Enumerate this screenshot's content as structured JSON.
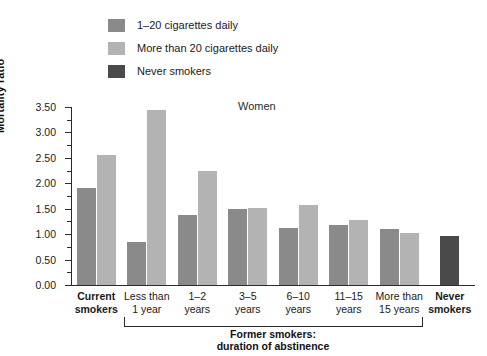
{
  "chart_data": {
    "type": "bar",
    "title": "Women",
    "xlabel": "",
    "ylabel": "Mortality ratio",
    "ylim": [
      0.0,
      3.5
    ],
    "ytick_labels": [
      "0.00",
      "0.50",
      "1.00",
      "1.50",
      "2.00",
      "2.50",
      "3.00",
      "3.50"
    ],
    "ytick_values": [
      0.0,
      0.5,
      1.0,
      1.5,
      2.0,
      2.5,
      3.0,
      3.5
    ],
    "minor_tick_interval": 0.25,
    "grid": false,
    "legend_position": "top-left",
    "categories": [
      "Current smokers",
      "Less than 1 year",
      "1–2 years",
      "3–5 years",
      "6–10 years",
      "11–15 years",
      "More than 15 years",
      "Never smokers"
    ],
    "series": [
      {
        "name": "1–20 cigarettes daily",
        "color": "#8a8a8a",
        "values": [
          1.9,
          0.85,
          1.37,
          1.5,
          1.12,
          1.18,
          1.1,
          null
        ]
      },
      {
        "name": "More than 20 cigarettes daily",
        "color": "#b3b3b3",
        "values": [
          2.55,
          3.45,
          2.25,
          1.52,
          1.57,
          1.27,
          1.03,
          null
        ]
      },
      {
        "name": "Never smokers",
        "color": "#4a4a4a",
        "values": [
          null,
          null,
          null,
          null,
          null,
          null,
          null,
          0.97
        ]
      }
    ],
    "annotations": [
      "Former smokers: duration of abstinence"
    ]
  },
  "legend": {
    "items": [
      {
        "label": "1–20 cigarettes daily",
        "color": "#8a8a8a"
      },
      {
        "label": "More than 20 cigarettes daily",
        "color": "#b3b3b3"
      },
      {
        "label": "Never smokers",
        "color": "#4a4a4a"
      }
    ]
  },
  "axis": {
    "y_title": "Mortality ratio",
    "y_labels": [
      "3.50",
      "3.00",
      "2.50",
      "2.00",
      "1.50",
      "1.00",
      "0.50",
      "0.00"
    ]
  },
  "categories": [
    {
      "line1": "Current",
      "line2": "smokers",
      "bold": true
    },
    {
      "line1": "Less than",
      "line2": "1 year",
      "bold": false
    },
    {
      "line1": "1–2",
      "line2": "years",
      "bold": false
    },
    {
      "line1": "3–5",
      "line2": "years",
      "bold": false
    },
    {
      "line1": "6–10",
      "line2": "years",
      "bold": false
    },
    {
      "line1": "11–15",
      "line2": "years",
      "bold": false
    },
    {
      "line1": "More than",
      "line2": "15 years",
      "bold": false
    },
    {
      "line1": "Never",
      "line2": "smokers",
      "bold": true
    }
  ],
  "bracket": {
    "caption_line1": "Former smokers:",
    "caption_line2": "duration of abstinence"
  },
  "title": "Women"
}
